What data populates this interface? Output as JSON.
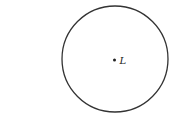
{
  "diagram": {
    "shape": "circle",
    "center_point": {
      "label": "L"
    },
    "stroke_color": "#333333",
    "background": "#ffffff"
  }
}
